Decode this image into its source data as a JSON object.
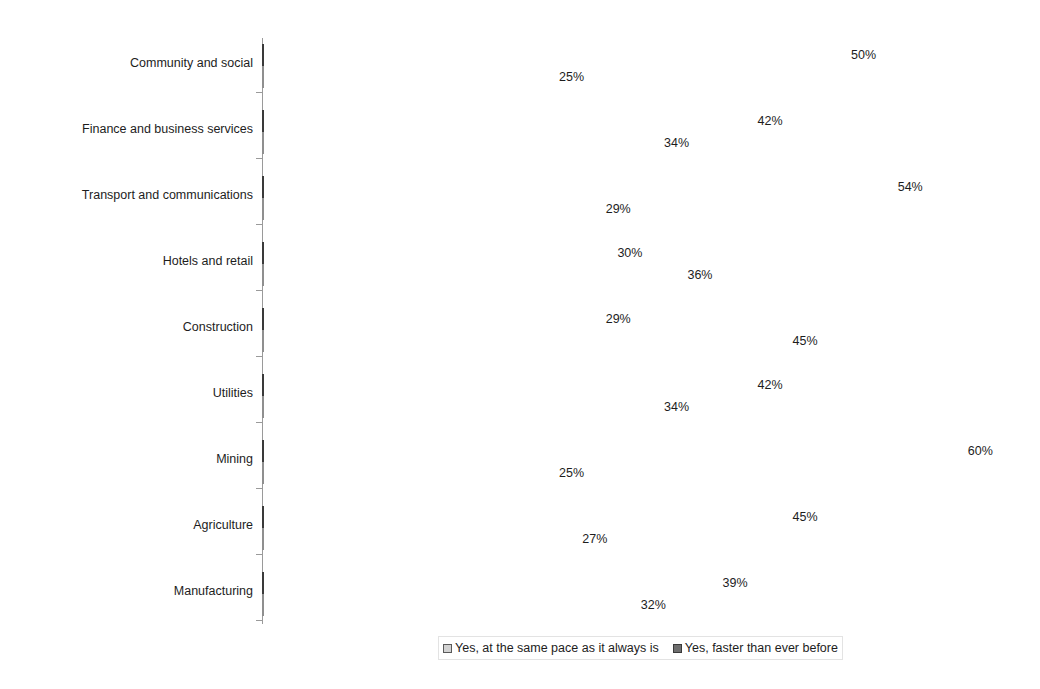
{
  "chart_data": {
    "type": "bar",
    "orientation": "horizontal",
    "title": "",
    "xlabel": "",
    "ylabel": "",
    "xlim": [
      0,
      60
    ],
    "grid": false,
    "value_suffix": "%",
    "legend_position": "bottom",
    "categories": [
      "Community and social",
      "Finance and business services",
      "Transport and communications",
      "Hotels and retail",
      "Construction",
      "Utilities",
      "Mining",
      "Agriculture",
      "Manufacturing"
    ],
    "series": [
      {
        "name": "Yes, faster than ever before",
        "color": "#6e6e6e",
        "values": [
          50,
          42,
          54,
          30,
          29,
          42,
          60,
          45,
          39
        ],
        "labels": [
          "50%",
          "42%",
          "54%",
          "30%",
          "29%",
          "42%",
          "60%",
          "45%",
          "39%"
        ]
      },
      {
        "name": "Yes, at the same pace as it always is",
        "color": "#c6c6c6",
        "values": [
          25,
          34,
          29,
          36,
          45,
          34,
          25,
          27,
          32
        ],
        "labels": [
          "25%",
          "34%",
          "29%",
          "36%",
          "45%",
          "34%",
          "25%",
          "27%",
          "32%"
        ]
      }
    ],
    "legend": [
      {
        "label": "Yes, at the same pace as it always is",
        "swatch": "light"
      },
      {
        "label": "Yes, faster than ever before",
        "swatch": "dark"
      }
    ]
  }
}
